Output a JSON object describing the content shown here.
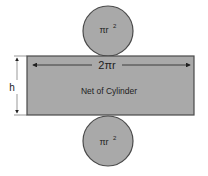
{
  "diagram": {
    "title": "Net of Cylinder",
    "top_circle": {
      "label": "πr",
      "exponent": "2"
    },
    "bottom_circle": {
      "label": "πr",
      "exponent": "2"
    },
    "rectangle": {
      "width_label": "2πr",
      "height_label": "h",
      "caption": "Net of Cylinder"
    },
    "colors": {
      "fill": "#a9a9a9",
      "stroke": "#4a4a4a",
      "text": "#222222"
    }
  }
}
